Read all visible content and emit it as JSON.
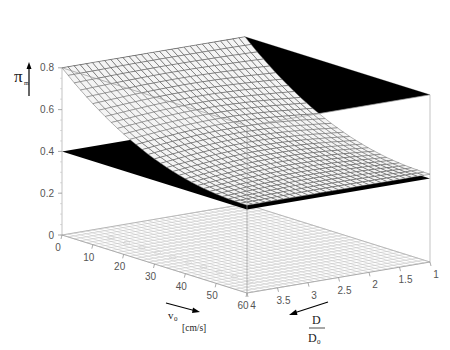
{
  "chart_data": {
    "type": "surface3d",
    "title": "",
    "zlabel": "π_m",
    "zlabel_main": "π",
    "zlabel_sub": "m",
    "xlabel": "v0 [cm/s]",
    "xlabel_main": "v",
    "xlabel_sub": "0",
    "xlabel_unit": "[cm/s]",
    "ylabel": "D/D0",
    "ylabel_num": "D",
    "ylabel_den_main": "D",
    "ylabel_den_sub": "0",
    "x_axis": {
      "name": "v0",
      "range": [
        0,
        60
      ],
      "ticks": [
        0,
        10,
        20,
        30,
        40,
        50,
        60
      ]
    },
    "y_axis": {
      "name": "D/D0",
      "range": [
        1,
        4
      ],
      "ticks": [
        1,
        1.5,
        2,
        2.5,
        3,
        3.5,
        4
      ]
    },
    "z_axis": {
      "name": "pi_m",
      "range": [
        0,
        0.8
      ],
      "ticks": [
        0,
        0.2,
        0.4,
        0.6,
        0.8
      ]
    },
    "planes": [
      {
        "name": "upper-plane",
        "z": 0.8,
        "color": "#000000"
      },
      {
        "name": "lower-plane",
        "z": 0.4,
        "color": "#000000"
      }
    ],
    "surface": {
      "description": "Mesh surface, values read at grid corners",
      "x": [
        0,
        60
      ],
      "y": [
        1,
        4
      ],
      "corner_values": {
        "v0=0,D/D0=4": 0.8,
        "v0=60,D/D0=4": 0.42,
        "v0=60,D/D0=1": 0.42,
        "v0=0,D/D0=1": 0.8
      },
      "grid_color": "#555555",
      "grid_lines_x": 30,
      "grid_lines_y": 30
    },
    "floor_grid": {
      "z": 0,
      "lines": 30,
      "color": "#bbbbbb"
    },
    "grid": false,
    "legend": null
  }
}
